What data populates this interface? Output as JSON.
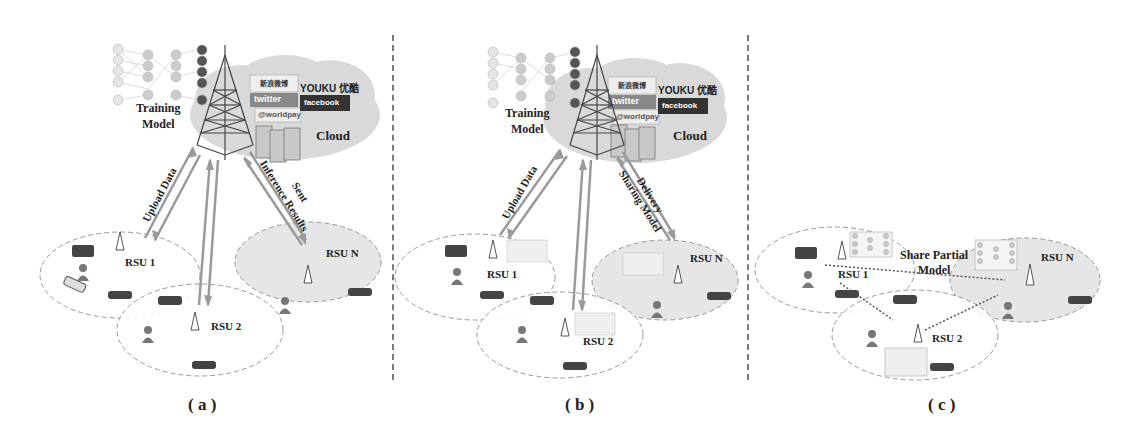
{
  "figure": {
    "panels": [
      {
        "id": "a",
        "caption": "( a )",
        "training_label_line1": "Training",
        "training_label_line2": "Model",
        "cloud_label": "Cloud",
        "arrow_left_label": "Upload Data",
        "arrow_right_label_line1": "Sent",
        "arrow_right_label_line2": "Inference Results",
        "rsus": [
          "RSU 1",
          "RSU 2",
          "RSU N"
        ],
        "brands": {
          "weibo": "新浪微博",
          "youku": "YOUKU 优酷",
          "twitter": "twitter",
          "facebook": "facebook",
          "worldpay": "@worldpay"
        }
      },
      {
        "id": "b",
        "caption": "( b )",
        "training_label_line1": "Training",
        "training_label_line2": "Model",
        "cloud_label": "Cloud",
        "arrow_left_label": "Upload Data",
        "arrow_right_label_line1": "Delivery",
        "arrow_right_label_line2": "Sharing Model",
        "rsus": [
          "RSU 1",
          "RSU 2",
          "RSU N"
        ],
        "brands": {
          "weibo": "新浪微博",
          "youku": "YOUKU 优酷",
          "twitter": "twitter",
          "facebook": "facebook",
          "worldpay": "@worldpay"
        }
      },
      {
        "id": "c",
        "caption": "( c )",
        "share_label_line1": "Share Partial",
        "share_label_line2": "Model",
        "rsus": [
          "RSU 1",
          "RSU 2",
          "RSU N"
        ]
      }
    ],
    "colors": {
      "arrow": "#9a9a9a",
      "cloud": "#d9d9d9",
      "rsu_n_fill": "#e6e6e6",
      "dashed": "#8a8a8a",
      "text": "#222222"
    }
  }
}
